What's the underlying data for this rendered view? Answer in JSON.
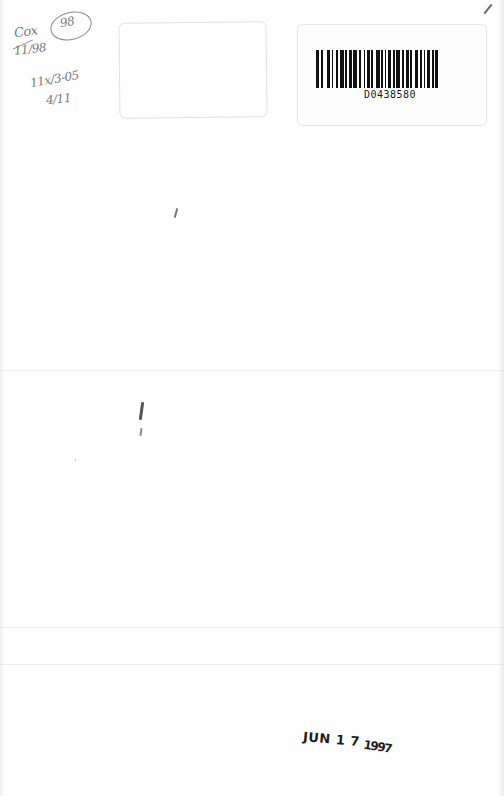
{
  "document": {
    "type": "book endsheet scan",
    "handwritten_notes": {
      "line1": "Cox",
      "line2": "11/98",
      "circled": "98",
      "line3": "11x/3-05",
      "line4": "4/11"
    },
    "barcode_label": {
      "number": "D0438580"
    },
    "date_stamp": {
      "month_day": "JUN 1 7",
      "year": "1997"
    }
  }
}
